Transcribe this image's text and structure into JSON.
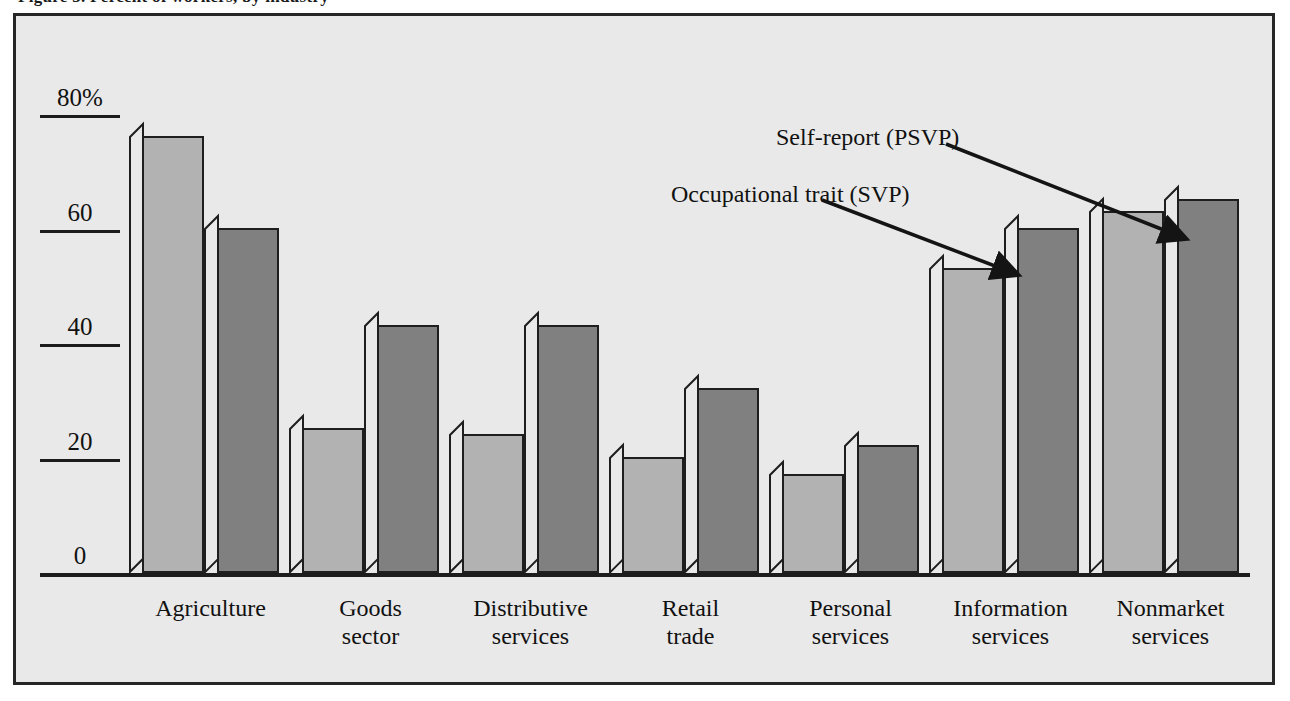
{
  "figure": {
    "clipped_title": "Figure 3. Percent of workers, by industry"
  },
  "chart_data": {
    "type": "bar",
    "title": "",
    "xlabel": "",
    "ylabel": "",
    "ylim": [
      0,
      80
    ],
    "yticks": [
      {
        "value": 80,
        "label": "80%"
      },
      {
        "value": 60,
        "label": "60"
      },
      {
        "value": 40,
        "label": "40"
      },
      {
        "value": 20,
        "label": "20"
      },
      {
        "value": 0,
        "label": "0"
      }
    ],
    "grid": false,
    "legend_position": "callout-annotations",
    "categories": [
      "Agriculture",
      "Goods sector",
      "Distributive services",
      "Retail trade",
      "Personal services",
      "Information services",
      "Nonmarket services"
    ],
    "category_lines": [
      [
        "Agriculture",
        ""
      ],
      [
        "Goods",
        "sector"
      ],
      [
        "Distributive",
        "services"
      ],
      [
        "Retail",
        "trade"
      ],
      [
        "Personal",
        "services"
      ],
      [
        "Information",
        "services"
      ],
      [
        "Nonmarket",
        "services"
      ]
    ],
    "series": [
      {
        "name": "Self-report (PSVP)",
        "color": "#b2b2b2",
        "values": [
          76,
          25,
          24,
          20,
          17,
          53,
          63
        ]
      },
      {
        "name": "Occupational trait (SVP)",
        "color": "#808080",
        "values": [
          60,
          43,
          43,
          32,
          22,
          60,
          65
        ]
      }
    ],
    "annotations": [
      {
        "text": "Self-report (PSVP)",
        "points_to": "Information services light bar"
      },
      {
        "text": "Occupational trait (SVP)",
        "points_to": "Information services dark bar"
      }
    ]
  },
  "colors": {
    "background": "#e9e9e9",
    "frame": "#262626",
    "axis": "#1c1c1c",
    "light_bar": "#b2b2b2",
    "dark_bar": "#808080",
    "text": "#111111"
  }
}
